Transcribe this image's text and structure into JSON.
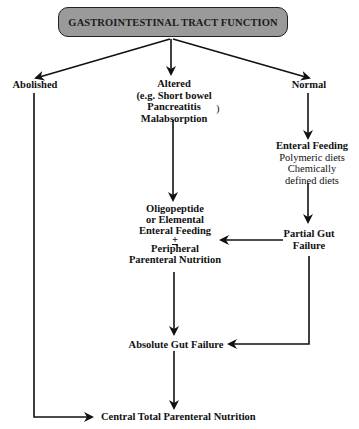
{
  "diagram": {
    "title": "GASTROINTESTINAL TRACT FUNCTION",
    "header_color": "#9a9a9a",
    "nodes": {
      "abolished": {
        "label": "Abolished"
      },
      "altered": {
        "lines": [
          "Altered",
          "(e.g. Short bowel",
          "Pancreatitis",
          "Malabsorption"
        ],
        "closing_paren": ")"
      },
      "normal": {
        "label": "Normal"
      },
      "enteral_feeding": {
        "title": "Enteral Feeding",
        "lines": [
          "Polymeric diets",
          "Chemically",
          "defined diets"
        ]
      },
      "partial_gut_failure": {
        "lines": [
          "Partial Gut",
          "Failure"
        ]
      },
      "oligopeptide": {
        "lines": [
          "Oligopeptide",
          "or Elemental",
          "Enteral Feeding",
          "+",
          "Peripheral",
          "Parenteral Nutrition"
        ]
      },
      "absolute_gut_failure": {
        "label": "Absolute Gut Failure"
      },
      "central_tpn": {
        "label": "Central Total Parenteral Nutrition"
      }
    },
    "edges": [
      {
        "from": "header",
        "to": "abolished"
      },
      {
        "from": "header",
        "to": "altered"
      },
      {
        "from": "header",
        "to": "normal"
      },
      {
        "from": "normal",
        "to": "enteral_feeding"
      },
      {
        "from": "enteral_feeding",
        "to": "partial_gut_failure"
      },
      {
        "from": "altered",
        "to": "oligopeptide"
      },
      {
        "from": "partial_gut_failure",
        "to": "oligopeptide"
      },
      {
        "from": "partial_gut_failure",
        "to": "absolute_gut_failure"
      },
      {
        "from": "oligopeptide",
        "to": "absolute_gut_failure"
      },
      {
        "from": "absolute_gut_failure",
        "to": "central_tpn"
      },
      {
        "from": "abolished",
        "to": "central_tpn"
      }
    ]
  }
}
